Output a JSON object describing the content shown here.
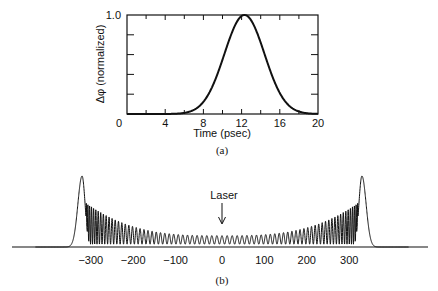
{
  "chart_data": [
    {
      "panel": "a",
      "type": "line",
      "caption": "(a)",
      "title": "",
      "xlabel": "Time (psec)",
      "ylabel": "Δφ (normalized)",
      "xlim": [
        0,
        20
      ],
      "ylim": [
        0,
        1.0
      ],
      "x_ticks": [
        0,
        4,
        8,
        12,
        16,
        20
      ],
      "x_tick_labels": [
        "0",
        "4",
        "8",
        "12",
        "16",
        "20"
      ],
      "y_tick_labels": [
        "0",
        "1.0"
      ],
      "y_minor_ticks": [
        0.2,
        0.4,
        0.6,
        0.8
      ],
      "grid": false,
      "series": [
        {
          "name": "Δφ",
          "shape": "gaussian",
          "center": 12.3,
          "sigma": 2.1,
          "x": [
            0,
            4,
            6,
            8,
            10,
            11,
            12,
            12.3,
            13,
            14,
            16,
            18,
            20
          ],
          "y": [
            0.0,
            0.0,
            0.01,
            0.13,
            0.55,
            0.85,
            0.99,
            1.0,
            0.95,
            0.72,
            0.21,
            0.03,
            0.0
          ]
        }
      ]
    },
    {
      "panel": "b",
      "type": "line",
      "caption": "(b)",
      "title": "",
      "xlabel": "",
      "ylabel": "",
      "annotation": "Laser",
      "annotation_x": 0,
      "x_tick_labels": [
        "−300",
        "−200",
        "−100",
        "0",
        "100",
        "200",
        "300"
      ],
      "x_ticks": [
        -300,
        -200,
        -100,
        0,
        100,
        200,
        300
      ],
      "xlim": [
        -440,
        440
      ],
      "grid": false,
      "series": [
        {
          "name": "spectrum",
          "description": "Symmetric self-phase-modulation broadened spectrum with oscillatory structure; outermost peaks are highest at about ±330",
          "outer_peak_positions": [
            -330,
            330
          ],
          "outer_peak_height": 1.0,
          "inner_peak_heights_approx": [
            0.62,
            0.52,
            0.47,
            0.42,
            0.38,
            0.35,
            0.32,
            0.3
          ]
        }
      ]
    }
  ]
}
